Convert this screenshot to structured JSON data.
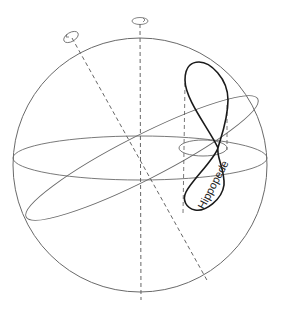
{
  "diagram": {
    "label": "Hippopede",
    "colors": {
      "sphere": "#6a6a6a",
      "curve": "#1a1a1a",
      "axis": "#555555"
    }
  }
}
